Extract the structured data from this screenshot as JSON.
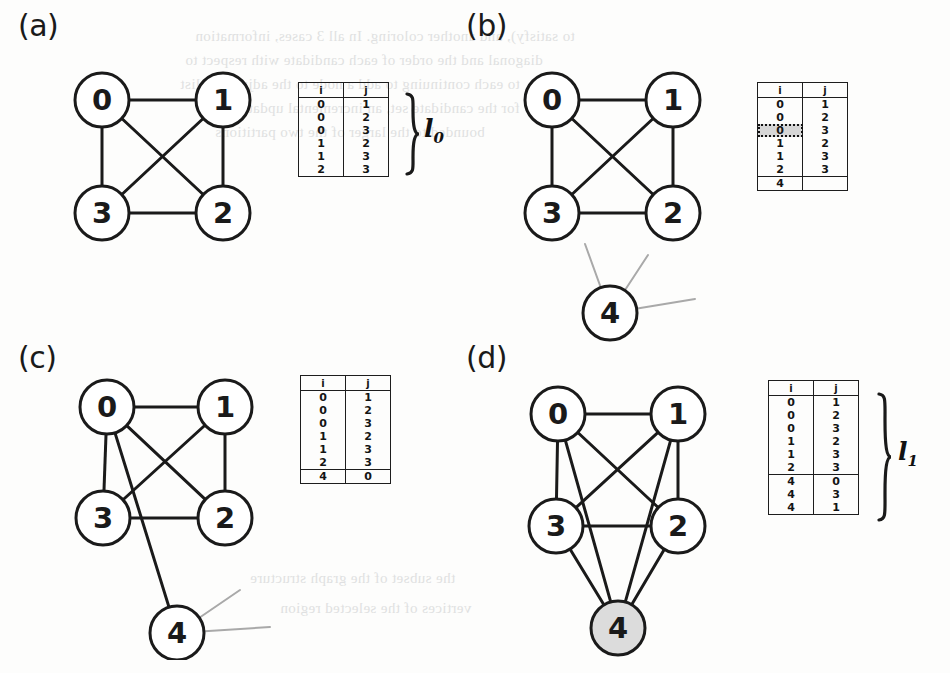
{
  "figure": {
    "background_color": "#fdfdfc",
    "ink_color": "#1a1a1a",
    "ghost_edge_color": "#a9a9a9",
    "highlight_fill": "#d6d6d6"
  },
  "bleed_text": [
    {
      "text": "to satisfy), and another coloring. In all 3 cases, information",
      "x": 195,
      "y": 28
    },
    {
      "text": "diagonal and the order of each candidate with respect to",
      "x": 185,
      "y": 52
    },
    {
      "text": "to each continuing to add a node to the adjacency list",
      "x": 180,
      "y": 76
    },
    {
      "text": "for the candidate set, an incremental update of the",
      "x": 200,
      "y": 100
    },
    {
      "text": "bounded to the larger of the two partitions",
      "x": 215,
      "y": 124
    },
    {
      "text": "the subset of the graph structure",
      "x": 250,
      "y": 570
    },
    {
      "text": "vertices of the selected region",
      "x": 280,
      "y": 600
    }
  ],
  "panels": [
    {
      "id": "a",
      "label": "(a)",
      "label_x": 18,
      "label_y": 8,
      "graph": {
        "origin_x": 55,
        "origin_y": 58,
        "width": 215,
        "height": 185,
        "node_radius": 27,
        "nodes": [
          {
            "id": "0",
            "cx": 47,
            "cy": 42,
            "fill": "#ffffff"
          },
          {
            "id": "1",
            "cx": 168,
            "cy": 42,
            "fill": "#ffffff"
          },
          {
            "id": "3",
            "cx": 47,
            "cy": 155,
            "fill": "#ffffff"
          },
          {
            "id": "2",
            "cx": 168,
            "cy": 155,
            "fill": "#ffffff"
          }
        ],
        "edges": [
          {
            "from": "0",
            "to": "1",
            "style": "solid"
          },
          {
            "from": "0",
            "to": "3",
            "style": "solid"
          },
          {
            "from": "0",
            "to": "2",
            "style": "solid"
          },
          {
            "from": "1",
            "to": "3",
            "style": "solid"
          },
          {
            "from": "1",
            "to": "2",
            "style": "solid"
          },
          {
            "from": "3",
            "to": "2",
            "style": "solid"
          }
        ],
        "ghost_edges": []
      },
      "table": {
        "x": 298,
        "y": 82,
        "headers": [
          "i",
          "j"
        ],
        "rows": [
          {
            "i": "0",
            "j": "1"
          },
          {
            "i": "0",
            "j": "2"
          },
          {
            "i": "0",
            "j": "3"
          },
          {
            "i": "1",
            "j": "2"
          },
          {
            "i": "1",
            "j": "3"
          },
          {
            "i": "2",
            "j": "3"
          }
        ],
        "appended_rows": [],
        "highlight_row": -1
      },
      "brace": {
        "show": true,
        "x": 404,
        "y": 92,
        "height": 84,
        "label": "l",
        "sub": "0",
        "label_x": 424,
        "label_y": 114
      }
    },
    {
      "id": "b",
      "label": "(b)",
      "label_x": 466,
      "label_y": 8,
      "graph": {
        "origin_x": 505,
        "origin_y": 58,
        "width": 230,
        "height": 285,
        "node_radius": 27,
        "nodes": [
          {
            "id": "0",
            "cx": 47,
            "cy": 42,
            "fill": "#ffffff"
          },
          {
            "id": "1",
            "cx": 168,
            "cy": 42,
            "fill": "#ffffff"
          },
          {
            "id": "3",
            "cx": 47,
            "cy": 155,
            "fill": "#ffffff"
          },
          {
            "id": "2",
            "cx": 168,
            "cy": 155,
            "fill": "#ffffff"
          },
          {
            "id": "4",
            "cx": 105,
            "cy": 255,
            "fill": "#ffffff"
          }
        ],
        "edges": [
          {
            "from": "0",
            "to": "1",
            "style": "solid"
          },
          {
            "from": "0",
            "to": "3",
            "style": "solid"
          },
          {
            "from": "0",
            "to": "2",
            "style": "solid"
          },
          {
            "from": "1",
            "to": "3",
            "style": "solid"
          },
          {
            "from": "1",
            "to": "2",
            "style": "solid"
          },
          {
            "from": "3",
            "to": "2",
            "style": "solid"
          }
        ],
        "ghost_edges": [
          {
            "x1": 105,
            "y1": 255,
            "x2": 80,
            "y2": 186
          },
          {
            "x1": 105,
            "y1": 255,
            "x2": 143,
            "y2": 197
          },
          {
            "x1": 105,
            "y1": 255,
            "x2": 190,
            "y2": 241
          }
        ]
      },
      "table": {
        "x": 757,
        "y": 82,
        "headers": [
          "i",
          "j"
        ],
        "rows": [
          {
            "i": "0",
            "j": "1"
          },
          {
            "i": "0",
            "j": "2"
          },
          {
            "i": "0",
            "j": "3"
          },
          {
            "i": "1",
            "j": "2"
          },
          {
            "i": "1",
            "j": "3"
          },
          {
            "i": "2",
            "j": "3"
          }
        ],
        "appended_rows": [
          {
            "i": "4",
            "j": ""
          }
        ],
        "highlight_row": 2
      },
      "brace": {
        "show": false
      }
    },
    {
      "id": "c",
      "label": "(c)",
      "label_x": 18,
      "label_y": 340,
      "graph": {
        "origin_x": 55,
        "origin_y": 375,
        "width": 230,
        "height": 285,
        "node_radius": 27,
        "nodes": [
          {
            "id": "0",
            "cx": 52,
            "cy": 32,
            "fill": "#ffffff"
          },
          {
            "id": "1",
            "cx": 170,
            "cy": 32,
            "fill": "#ffffff"
          },
          {
            "id": "3",
            "cx": 48,
            "cy": 143,
            "fill": "#ffffff"
          },
          {
            "id": "2",
            "cx": 170,
            "cy": 143,
            "fill": "#ffffff"
          },
          {
            "id": "4",
            "cx": 122,
            "cy": 258,
            "fill": "#ffffff"
          }
        ],
        "edges": [
          {
            "from": "0",
            "to": "1",
            "style": "solid"
          },
          {
            "from": "0",
            "to": "3",
            "style": "solid"
          },
          {
            "from": "0",
            "to": "2",
            "style": "solid"
          },
          {
            "from": "1",
            "to": "3",
            "style": "solid"
          },
          {
            "from": "1",
            "to": "2",
            "style": "solid"
          },
          {
            "from": "3",
            "to": "2",
            "style": "solid"
          },
          {
            "from": "0",
            "to": "4",
            "style": "solid"
          }
        ],
        "ghost_edges": [
          {
            "x1": 122,
            "y1": 258,
            "x2": 185,
            "y2": 215
          },
          {
            "x1": 122,
            "y1": 258,
            "x2": 215,
            "y2": 252
          }
        ]
      },
      "table": {
        "x": 300,
        "y": 375,
        "headers": [
          "i",
          "j"
        ],
        "rows": [
          {
            "i": "0",
            "j": "1"
          },
          {
            "i": "0",
            "j": "2"
          },
          {
            "i": "0",
            "j": "3"
          },
          {
            "i": "1",
            "j": "2"
          },
          {
            "i": "1",
            "j": "3"
          },
          {
            "i": "2",
            "j": "3"
          }
        ],
        "appended_rows": [
          {
            "i": "4",
            "j": "0"
          }
        ],
        "highlight_row": -1
      },
      "brace": {
        "show": false
      }
    },
    {
      "id": "d",
      "label": "(d)",
      "label_x": 466,
      "label_y": 340,
      "graph": {
        "origin_x": 508,
        "origin_y": 378,
        "width": 230,
        "height": 285,
        "node_radius": 27,
        "nodes": [
          {
            "id": "0",
            "cx": 50,
            "cy": 36,
            "fill": "#ffffff"
          },
          {
            "id": "1",
            "cx": 170,
            "cy": 36,
            "fill": "#ffffff"
          },
          {
            "id": "3",
            "cx": 48,
            "cy": 148,
            "fill": "#ffffff"
          },
          {
            "id": "2",
            "cx": 170,
            "cy": 148,
            "fill": "#ffffff"
          },
          {
            "id": "4",
            "cx": 110,
            "cy": 250,
            "fill": "#dcdcdc"
          }
        ],
        "edges": [
          {
            "from": "0",
            "to": "1",
            "style": "solid"
          },
          {
            "from": "0",
            "to": "3",
            "style": "solid"
          },
          {
            "from": "0",
            "to": "2",
            "style": "solid"
          },
          {
            "from": "1",
            "to": "3",
            "style": "solid"
          },
          {
            "from": "1",
            "to": "2",
            "style": "solid"
          },
          {
            "from": "3",
            "to": "2",
            "style": "solid"
          },
          {
            "from": "4",
            "to": "0",
            "style": "solid"
          },
          {
            "from": "4",
            "to": "1",
            "style": "solid"
          },
          {
            "from": "4",
            "to": "2",
            "style": "solid"
          },
          {
            "from": "4",
            "to": "3",
            "style": "solid"
          }
        ],
        "ghost_edges": []
      },
      "table": {
        "x": 768,
        "y": 380,
        "headers": [
          "i",
          "j"
        ],
        "rows": [
          {
            "i": "0",
            "j": "1"
          },
          {
            "i": "0",
            "j": "2"
          },
          {
            "i": "0",
            "j": "3"
          },
          {
            "i": "1",
            "j": "2"
          },
          {
            "i": "1",
            "j": "3"
          },
          {
            "i": "2",
            "j": "3"
          }
        ],
        "appended_rows": [
          {
            "i": "4",
            "j": "0"
          },
          {
            "i": "4",
            "j": "3"
          },
          {
            "i": "4",
            "j": "1"
          }
        ],
        "highlight_row": -1
      },
      "brace": {
        "show": true,
        "x": 876,
        "y": 392,
        "height": 130,
        "label": "l",
        "sub": "1",
        "label_x": 898,
        "label_y": 437
      }
    }
  ]
}
